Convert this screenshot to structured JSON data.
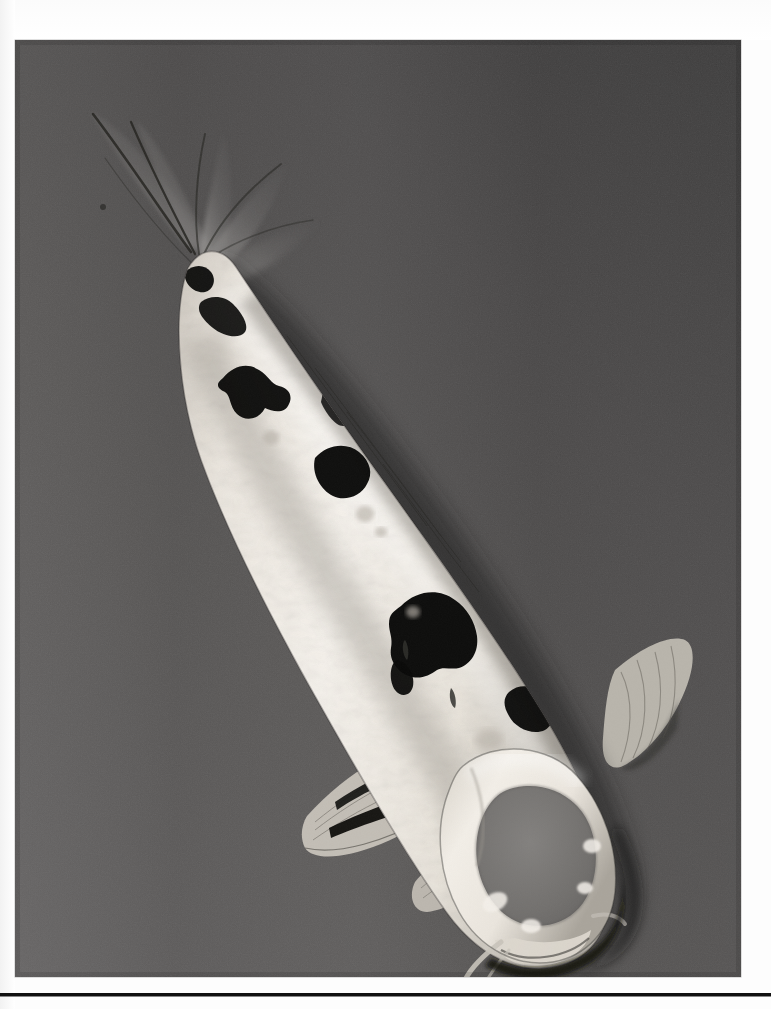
{
  "page": {
    "background_color": "#ffffff",
    "kind": "photographic-plate-on-white-page"
  },
  "photo": {
    "subject": "koi-fish-top-view",
    "caption": "",
    "rendering": "black-and-white-photograph",
    "frame": {
      "x": 15,
      "y": 40,
      "width": 726,
      "height": 937
    },
    "background": {
      "description": "uniform mid-grey pond water surface, slightly darker toward upper right",
      "color_light": "#636363",
      "color_mid": "#575757",
      "color_dark": "#3f3f3f"
    },
    "fish": {
      "species_look": "shiro-utsuri-koi",
      "orientation": "diagonal, tail upper-left, head lower-right",
      "body_color": "#efeae2",
      "marking_color": "#0d0d0d",
      "head_patch_color": "#6e6e6e",
      "parts": [
        {
          "name": "caudal-fin",
          "label": "tail fin",
          "color": "#6a6a6a"
        },
        {
          "name": "caudal-peduncle",
          "label": "tail base",
          "color": "#e8e3da"
        },
        {
          "name": "dorsal-fin",
          "label": "dorsal fin",
          "color": "#8d8d8d"
        },
        {
          "name": "body",
          "label": "body",
          "color": "#f1ece4"
        },
        {
          "name": "pectoral-fin-left",
          "label": "left pectoral fin",
          "color": "#c9c4ba"
        },
        {
          "name": "pectoral-fin-right",
          "label": "right pectoral fin",
          "color": "#bdb8ae"
        },
        {
          "name": "pelvic-fin",
          "label": "pelvic fin",
          "color": "#c4bfb5"
        },
        {
          "name": "head",
          "label": "head",
          "color": "#e4dfd6"
        },
        {
          "name": "mouth",
          "label": "mouth and barbels",
          "color": "#d6d1c7"
        }
      ],
      "sumi_patches_count": 11
    }
  },
  "rule": {
    "name": "horizontal-divider",
    "color": "#111111",
    "y": 993,
    "thickness": 3
  }
}
